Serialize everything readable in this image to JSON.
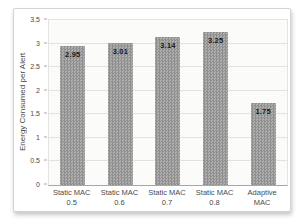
{
  "chart_data": {
    "type": "bar",
    "title": "",
    "xlabel": "",
    "ylabel": "Energy Consumed per Alert",
    "categories": [
      "Static MAC\n0.5",
      "Static MAC\n0.6",
      "Static MAC\n0.7",
      "Static MAC\n0.8",
      "Adaptive\nMAC"
    ],
    "values": [
      2.95,
      3.01,
      3.14,
      3.25,
      1.75
    ],
    "data_labels": [
      "2.95",
      "3.01",
      "3.14",
      "3.25",
      "1.75"
    ],
    "ylim": [
      0,
      3.5
    ],
    "yticks": [
      0,
      0.5,
      1,
      1.5,
      2,
      2.5,
      3,
      3.5
    ],
    "ytick_labels": [
      "0",
      "0.5",
      "1",
      "1.5",
      "2",
      "2.5",
      "3",
      "3.5"
    ],
    "grid": true,
    "legend": "none",
    "colors": {
      "bar_fill_light": "#aeaeae",
      "bar_fill_dark": "#8f8f8f",
      "gridline": "#e2e2e0",
      "axis_line": "#a6a6a6",
      "text": "#4a4a4a",
      "data_label": "#1a1a1a",
      "plot_bg": "#fbfbf9",
      "frame_border": "#d4d4d4"
    }
  }
}
